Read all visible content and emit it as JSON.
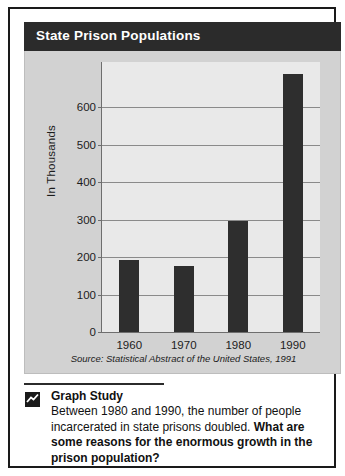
{
  "figure": {
    "title": "State Prison Populations",
    "source": "Source: Statistical Abstract of the United States, 1991"
  },
  "caption": {
    "icon": "line-chart-icon",
    "heading": "Graph Study",
    "text_plain": "Between 1980 and 1990, the number of people incarcerated in state prisons doubled. ",
    "text_bold": "What are some reasons for the enormous growth in the prison population?"
  },
  "colors": {
    "title_bar": "#2b2b2b",
    "bar_fill": "#2e2e2e",
    "plot_background": "#e9e9e9",
    "card_background": "#d2d2d2",
    "frame_border": "#1a1a1a"
  },
  "chart_data": {
    "type": "bar",
    "title": "State Prison Populations",
    "xlabel": "",
    "ylabel": "In Thousands",
    "categories": [
      "1960",
      "1970",
      "1980",
      "1990"
    ],
    "values": [
      192,
      176,
      295,
      688
    ],
    "yticks": [
      0,
      100,
      200,
      300,
      400,
      500,
      600
    ],
    "ylim": [
      0,
      720
    ],
    "grid": true,
    "legend": false,
    "units": "thousands of people",
    "source": "Source: Statistical Abstract of the United States, 1991"
  }
}
